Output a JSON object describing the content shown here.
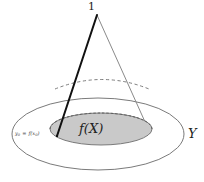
{
  "figure": {
    "kind": "cone-over-ellipse-diagram",
    "labels": {
      "apex": "1",
      "image_set": "f(X)",
      "codomain": "Y",
      "point_var": "y",
      "point_sub": "0",
      "point_eq": " = ",
      "point_fn": "f(x",
      "point_fn_sub": "0",
      "point_fn_close": ")"
    },
    "colors": {
      "background": "#ffffff",
      "shaded_region_fill": "#c9c9c9",
      "shaded_region_stroke": "#6e6e6e",
      "outer_ellipse_stroke": "#6b6b6b",
      "cone_edge_highlight": "#111111",
      "cone_edge_light": "#8a8a8a",
      "dashed_arc_stroke": "#707070",
      "text": "#222222"
    },
    "geometry": {
      "outer_ellipse": {
        "cx": 98,
        "cy": 134,
        "rx": 86,
        "ry": 36
      },
      "shaded_ellipse": {
        "cx": 101,
        "cy": 129,
        "rx": 51,
        "ry": 16
      },
      "cone_apex": {
        "x": 97,
        "y": 15
      },
      "cone_base_left": {
        "x": 57,
        "y": 136
      },
      "cone_base_right": {
        "x": 150,
        "y": 133
      },
      "dashed_arc": {
        "cx": 102,
        "cy": 80,
        "rx": 47,
        "ry": 12
      }
    }
  }
}
